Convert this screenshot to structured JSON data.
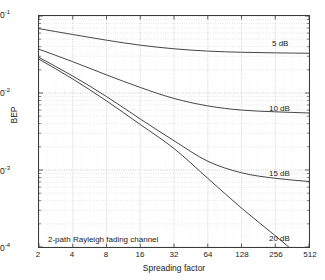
{
  "chart_data": {
    "type": "line",
    "title": "",
    "subtitle": "",
    "xlabel": "Spreading factor",
    "ylabel": "BEP",
    "xscale": "log2",
    "yscale": "log10",
    "xlim": [
      2,
      512
    ],
    "ylim": [
      0.0001,
      0.1
    ],
    "grid": true,
    "grid_style": "dotted-minor-and-major",
    "legend_position": "inline-right-annotations",
    "annotations": [
      {
        "text": "2-path Rayleigh fading channel",
        "x": 2.6,
        "y": 0.000135
      }
    ],
    "xticks": [
      2,
      4,
      8,
      16,
      32,
      64,
      128,
      256,
      512
    ],
    "xtick_labels": [
      "2",
      "4",
      "8",
      "16",
      "32",
      "64",
      "128",
      "256",
      "512"
    ],
    "yticks": [
      0.1,
      0.01,
      0.001,
      0.0001
    ],
    "ytick_labels": [
      "10-1",
      "10-2",
      "10-3",
      "10-4"
    ],
    "ytick_mantissa": [
      "10",
      "10",
      "10",
      "10"
    ],
    "ytick_exponent": [
      "-1",
      "-2",
      "-3",
      "-4"
    ],
    "x": [
      2,
      4,
      8,
      16,
      32,
      64,
      128,
      256,
      512
    ],
    "series": [
      {
        "name": "5 dB",
        "label": "5 dB",
        "color": "#3a3a3a",
        "label_x": 300,
        "label_y": 0.0395,
        "values": [
          0.0685,
          0.0575,
          0.0485,
          0.0418,
          0.0375,
          0.035,
          0.0338,
          0.0332,
          0.0328
        ]
      },
      {
        "name": "10 dB",
        "label": "10 dB",
        "color": "#3a3a3a",
        "label_x": 300,
        "label_y": 0.0068,
        "values": [
          0.037,
          0.0255,
          0.0172,
          0.0118,
          0.0085,
          0.0068,
          0.006,
          0.0057,
          0.0055
        ]
      },
      {
        "name": "15 dB",
        "label": "15 dB",
        "color": "#3a3a3a",
        "label_x": 300,
        "label_y": 0.00086,
        "values": [
          0.029,
          0.0166,
          0.009,
          0.0046,
          0.0024,
          0.0013,
          0.00092,
          0.00078,
          0.00071
        ]
      },
      {
        "name": "20 dB",
        "label": "20 dB",
        "color": "#3a3a3a",
        "label_x": 300,
        "label_y": 0.000135,
        "values": [
          0.0275,
          0.0152,
          0.0079,
          0.0039,
          0.0019,
          0.00078,
          0.00032,
          0.00014,
          6e-05
        ]
      }
    ]
  }
}
